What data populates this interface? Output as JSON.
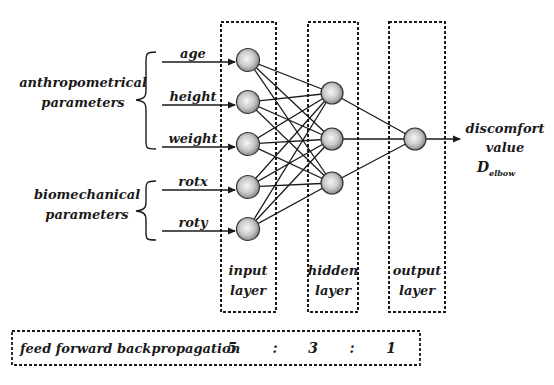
{
  "diagram": {
    "type": "neural-network",
    "groups": [
      {
        "id": "anthropometrical",
        "label_lines": [
          "anthropometrical",
          "parameters"
        ]
      },
      {
        "id": "biomechanical",
        "label_lines": [
          "biomechanical",
          "parameters"
        ]
      }
    ],
    "inputs": [
      {
        "label": "age",
        "group": "anthropometrical"
      },
      {
        "label": "height",
        "group": "anthropometrical"
      },
      {
        "label": "weight",
        "group": "anthropometrical"
      },
      {
        "label": "rotx",
        "group": "biomechanical"
      },
      {
        "label": "roty",
        "group": "biomechanical"
      }
    ],
    "layers": [
      {
        "id": "input",
        "label_lines": [
          "input",
          "layer"
        ],
        "nodes": 5
      },
      {
        "id": "hidden",
        "label_lines": [
          "hidden",
          "layer"
        ],
        "nodes": 3
      },
      {
        "id": "output",
        "label_lines": [
          "output",
          "layer"
        ],
        "nodes": 1
      }
    ],
    "output": {
      "label_lines": [
        "discomfort",
        "value"
      ],
      "symbol": "D",
      "subscript": "elbow"
    },
    "footer": {
      "method": "feed forward backpropagation",
      "ratio": [
        "5",
        ":",
        "3",
        ":",
        "1"
      ]
    }
  },
  "colors": {
    "line": "#1a1a1a",
    "node_fill_center": "#f4f4f4",
    "node_fill_edge": "#8a8a8a",
    "background": "#ffffff"
  }
}
